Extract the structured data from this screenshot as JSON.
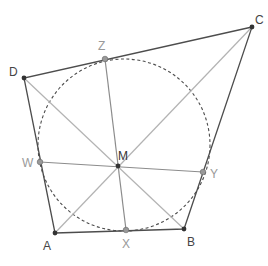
{
  "diagram": {
    "colors": {
      "edge": "#4d4d4d",
      "diagonal": "#b3b3b3",
      "midline": "#8c8c8c",
      "circle": "#4d4d4d",
      "vertex": "#333333",
      "touch_point": "#999999",
      "vertex_label": "#444444",
      "touch_label": "#999999",
      "center_label": "#333333"
    },
    "labels": {
      "A": "A",
      "B": "B",
      "C": "C",
      "D": "D",
      "M": "M",
      "W": "W",
      "X": "X",
      "Y": "Y",
      "Z": "Z"
    },
    "points": {
      "A": [
        55,
        233
      ],
      "B": [
        184,
        229
      ],
      "C": [
        252,
        27
      ],
      "D": [
        24,
        78
      ],
      "M": [
        118,
        166
      ],
      "W": [
        40,
        162
      ],
      "X": [
        126,
        230
      ],
      "Y": [
        203,
        172
      ],
      "Z": [
        105,
        59
      ]
    },
    "circle": {
      "cx": 124,
      "cy": 145,
      "r": 86
    }
  }
}
